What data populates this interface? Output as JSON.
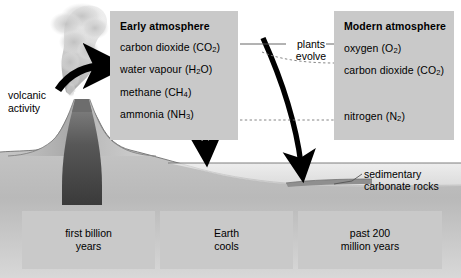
{
  "diagram": {
    "colors": {
      "panel_fill": "#c9c9c9",
      "background": "#ffffff",
      "arrow": "#000000",
      "land": "#b4b4b4",
      "magma": "#444444",
      "sediment": "#8f8f8f"
    }
  },
  "early_atmosphere": {
    "title": "Early atmosphere",
    "items": [
      {
        "name": "carbon dioxide",
        "formula_base": "CO",
        "formula_sub": "2"
      },
      {
        "name": "water vapour",
        "formula_base": "H",
        "formula_sub": "2",
        "formula_tail": "O"
      },
      {
        "name": "methane",
        "formula_base": "CH",
        "formula_sub": "4"
      },
      {
        "name": "ammonia",
        "formula_base": "NH",
        "formula_sub": "3"
      }
    ]
  },
  "modern_atmosphere": {
    "title": "Modern atmosphere",
    "items": [
      {
        "name": "oxygen",
        "formula_base": "O",
        "formula_sub": "2"
      },
      {
        "name": "carbon dioxide",
        "formula_base": "CO",
        "formula_sub": "2"
      },
      {
        "name": "nitrogen",
        "formula_base": "N",
        "formula_sub": "2"
      }
    ]
  },
  "connector": {
    "line1": "plants",
    "line2": "evolve"
  },
  "volcano": {
    "line1": "volcanic",
    "line2": "activity"
  },
  "sediment": {
    "line1": "sedimentary",
    "line2": "carbonate rocks"
  },
  "timeline": [
    {
      "line1": "first billion",
      "line2": "years"
    },
    {
      "line1": "Earth",
      "line2": "cools"
    },
    {
      "line1": "past 200",
      "line2": "million years"
    }
  ]
}
